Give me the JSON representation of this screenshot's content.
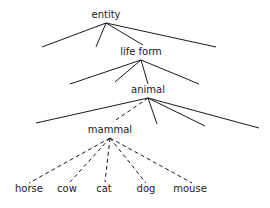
{
  "diagram": {
    "type": "taxonomy-tree",
    "nodes": [
      {
        "id": "entity",
        "label": "entity",
        "x": 106,
        "y": 18
      },
      {
        "id": "life_form",
        "label": "life form",
        "x": 141,
        "y": 55
      },
      {
        "id": "animal",
        "label": "animal",
        "x": 148,
        "y": 93
      },
      {
        "id": "mammal",
        "label": "mammal",
        "x": 110,
        "y": 133
      },
      {
        "id": "horse",
        "label": "horse",
        "x": 29,
        "y": 192
      },
      {
        "id": "cow",
        "label": "cow",
        "x": 67,
        "y": 192
      },
      {
        "id": "cat",
        "label": "cat",
        "x": 104,
        "y": 192
      },
      {
        "id": "dog",
        "label": "dog",
        "x": 146,
        "y": 192
      },
      {
        "id": "mouse",
        "label": "mouse",
        "x": 190,
        "y": 192
      }
    ],
    "edges": [
      {
        "from": [
          106,
          23
        ],
        "to": [
          42,
          47
        ],
        "style": "solid"
      },
      {
        "from": [
          106,
          23
        ],
        "to": [
          96,
          47
        ],
        "style": "solid"
      },
      {
        "from": [
          106,
          23
        ],
        "to": [
          143,
          45
        ],
        "style": "solid"
      },
      {
        "from": [
          106,
          23
        ],
        "to": [
          216,
          47
        ],
        "style": "solid"
      },
      {
        "from": [
          141,
          60
        ],
        "to": [
          70,
          84
        ],
        "style": "solid"
      },
      {
        "from": [
          141,
          60
        ],
        "to": [
          115,
          82
        ],
        "style": "solid"
      },
      {
        "from": [
          141,
          60
        ],
        "to": [
          148,
          84
        ],
        "style": "solid"
      },
      {
        "from": [
          141,
          60
        ],
        "to": [
          199,
          84
        ],
        "style": "solid"
      },
      {
        "from": [
          148,
          98
        ],
        "to": [
          36,
          123
        ],
        "style": "solid"
      },
      {
        "from": [
          148,
          98
        ],
        "to": [
          113,
          122
        ],
        "style": "dashed"
      },
      {
        "from": [
          148,
          98
        ],
        "to": [
          157,
          124
        ],
        "style": "solid"
      },
      {
        "from": [
          148,
          98
        ],
        "to": [
          205,
          126
        ],
        "style": "solid"
      },
      {
        "from": [
          148,
          98
        ],
        "to": [
          259,
          128
        ],
        "style": "solid"
      },
      {
        "from": [
          110,
          138
        ],
        "to": [
          29,
          183
        ],
        "style": "dashed"
      },
      {
        "from": [
          110,
          138
        ],
        "to": [
          70,
          182
        ],
        "style": "dashed"
      },
      {
        "from": [
          110,
          138
        ],
        "to": [
          105,
          182
        ],
        "style": "dashed"
      },
      {
        "from": [
          110,
          138
        ],
        "to": [
          146,
          183
        ],
        "style": "dashed"
      },
      {
        "from": [
          110,
          138
        ],
        "to": [
          192,
          183
        ],
        "style": "dashed"
      }
    ]
  }
}
